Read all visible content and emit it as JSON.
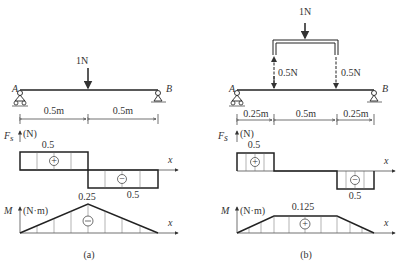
{
  "panels": [
    {
      "caption": "(a)",
      "load": "1N",
      "support_left": "A",
      "support_right": "B",
      "dims": [
        "0.5m",
        "0.5m"
      ],
      "shear_axis": {
        "symbol": "F",
        "sub": "s",
        "unit": "(N)",
        "x": "x"
      },
      "shear_values": {
        "top": "0.5",
        "bottom": "0.5"
      },
      "shear_signs": [
        "+",
        "−"
      ],
      "moment_axis": {
        "symbol": "M",
        "unit": "(N·m)",
        "x": "x"
      },
      "moment_peak": "0.25",
      "moment_sign": "⊖"
    },
    {
      "caption": "(b)",
      "load": "1N",
      "reactions": [
        "0.5N",
        "0.5N"
      ],
      "support_left": "A",
      "support_right": "B",
      "dims": [
        "0.25m",
        "0.5m",
        "0.25m"
      ],
      "shear_axis": {
        "symbol": "F",
        "sub": "s",
        "unit": "(N)",
        "x": "x"
      },
      "shear_values": {
        "top": "0.5",
        "bottom": "0.5"
      },
      "shear_signs": [
        "+",
        "−"
      ],
      "moment_axis": {
        "symbol": "M",
        "unit": "(N·m)",
        "x": "x"
      },
      "moment_peak": "0.125",
      "moment_sign": "+"
    }
  ]
}
